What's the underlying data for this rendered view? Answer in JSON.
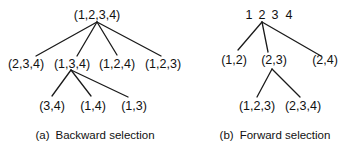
{
  "panel_a": {
    "tag": "(a)",
    "caption": "Backward selection",
    "root": "(1,2,3,4)",
    "level1": [
      "(2,3,4)",
      "(1,3,4)",
      "(1,2,4)",
      "(1,2,3)"
    ],
    "level2": [
      "(3,4)",
      "(1,4)",
      "(1,3)"
    ]
  },
  "panel_b": {
    "tag": "(b)",
    "caption": "Forward selection",
    "root_items": [
      "1",
      "2",
      "3",
      "4"
    ],
    "level1": [
      "(1,2)",
      "(2,3)",
      "(2,4)"
    ],
    "level2": [
      "(1,2,3)",
      "(2,3,4)"
    ]
  }
}
